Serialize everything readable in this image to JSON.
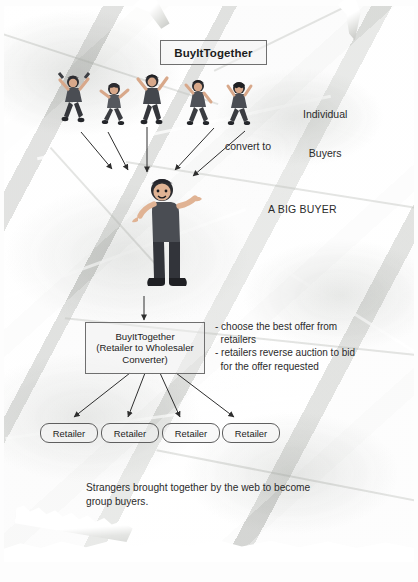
{
  "diagram": {
    "title_box": {
      "label": "BuyItTogether"
    },
    "labels": {
      "individual_buyers_line1": "Individual",
      "individual_buyers_line2": "Buyers",
      "convert_to": "convert to",
      "a_big_buyer": "A BIG BUYER"
    },
    "converter_box": {
      "line1": "BuyItTogether",
      "line2": "(Retailer to Wholesaler",
      "line3": "Converter)"
    },
    "bullets": [
      "- choose the best offer from",
      "  retailers",
      "- retailers reverse auction to bid",
      "  for the offer requested"
    ],
    "retailers": [
      {
        "label": "Retailer"
      },
      {
        "label": "Retailer"
      },
      {
        "label": "Retailer"
      },
      {
        "label": "Retailer"
      }
    ],
    "caption_line1": "Strangers brought together by the web to become",
    "caption_line2": "group buyers.",
    "buyers_count": 5,
    "colors": {
      "paper": "#f2f2f1",
      "ink": "#2b2b2b",
      "box_border": "#6f6f6f",
      "figure_dark": "#3d3f44",
      "figure_skin": "#d8a88a",
      "figure_hair": "#2c2c30"
    }
  }
}
